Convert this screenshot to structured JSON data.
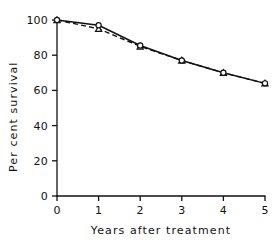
{
  "chart_data": {
    "type": "line",
    "title": "",
    "subtitle": "",
    "xlabel": "Years after treatment",
    "ylabel": "Per cent survival",
    "xlim": [
      0,
      5
    ],
    "ylim": [
      0,
      100
    ],
    "xticks": [
      0,
      1,
      2,
      3,
      4,
      5
    ],
    "yticks": [
      0,
      20,
      40,
      60,
      80,
      100
    ],
    "xtick_labels": [
      "0",
      "1",
      "2",
      "3",
      "4",
      "5"
    ],
    "ytick_labels": [
      "0",
      "20",
      "40",
      "60",
      "80",
      "100"
    ],
    "grid": false,
    "legend": "none",
    "x": [
      0,
      1,
      2,
      3,
      4,
      5
    ],
    "series": [
      {
        "name": "solid-series",
        "style": "solid",
        "marker": "open-circle",
        "values": [
          100,
          97,
          85.5,
          77,
          70,
          64
        ]
      },
      {
        "name": "dashed-series",
        "style": "dashed",
        "marker": "open-triangle",
        "values": [
          100,
          95,
          85,
          77,
          70,
          64
        ]
      }
    ],
    "annotations": []
  }
}
